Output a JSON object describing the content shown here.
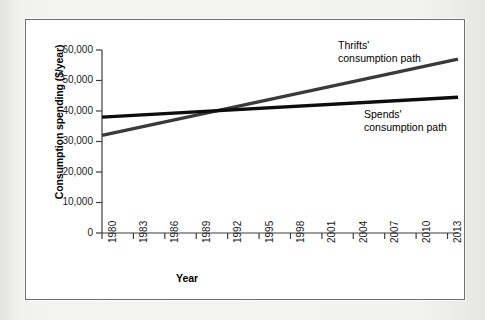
{
  "figure": {
    "panel_background": "#ffffff",
    "panel_border_color": "#6f6f6f",
    "page_background": "#eeeeec"
  },
  "chart_data": {
    "type": "line",
    "title": "",
    "xlabel": "Year",
    "ylabel": "Consumption spending ($/year)",
    "xlim": [
      1980,
      2014
    ],
    "ylim": [
      0,
      60000
    ],
    "grid": false,
    "legend_position": "inline-annotations",
    "x_tick_labels": [
      "1980",
      "1983",
      "1986",
      "1989",
      "1992",
      "1995",
      "1998",
      "2001",
      "2004",
      "2007",
      "2010",
      "2013"
    ],
    "x_tick_values": [
      1980,
      1983,
      1986,
      1989,
      1992,
      1995,
      1998,
      2001,
      2004,
      2007,
      2010,
      2013
    ],
    "y_tick_labels": [
      "0",
      "10,000",
      "20,000",
      "30,000",
      "40,000",
      "50,000",
      "60,000"
    ],
    "y_tick_values": [
      0,
      10000,
      20000,
      30000,
      40000,
      50000,
      60000
    ],
    "x": [
      1980,
      2014
    ],
    "series": [
      {
        "name": "Thrifts' consumption path",
        "values": [
          32000,
          57000
        ],
        "color": "#3a3a3a",
        "width": 3.2,
        "annotation": "Thrifts'\nconsumption path"
      },
      {
        "name": "Spends' consumption path",
        "values": [
          38000,
          44500
        ],
        "color": "#0d0d0d",
        "width": 3.4,
        "annotation": "Spends'\nconsumption path"
      }
    ],
    "annotations": [
      {
        "text": "Thrifts'\nconsumption path",
        "x": 2004,
        "y": 58500
      },
      {
        "text": "Spends'\nconsumption path",
        "x": 2007,
        "y": 36500
      }
    ],
    "crossover": {
      "x": 1994,
      "y": 40500
    }
  },
  "axis": {
    "x_title": "Year",
    "y_title": "Consumption spending ($/year)",
    "axis_color": "#3d3d3d"
  }
}
